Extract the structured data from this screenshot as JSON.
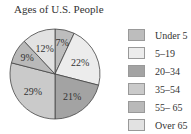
{
  "chart_data": {
    "type": "pie",
    "title": "Ages of U.S. People",
    "categories": [
      "Under 5",
      "5–19",
      "20–34",
      "35–54",
      "55– 65",
      "Over 65"
    ],
    "values": [
      7,
      22,
      21,
      29,
      9,
      12
    ],
    "unit": "%",
    "colors": [
      "#bdbdbd",
      "#ececec",
      "#a3a3a3",
      "#cacaca",
      "#b9b9b9",
      "#e2e2e2"
    ],
    "start_angle": "12 o'clock",
    "direction": "clockwise",
    "legend_position": "right"
  },
  "labels": [
    "7%",
    "22%",
    "21%",
    "29%",
    "9%",
    "12%"
  ]
}
